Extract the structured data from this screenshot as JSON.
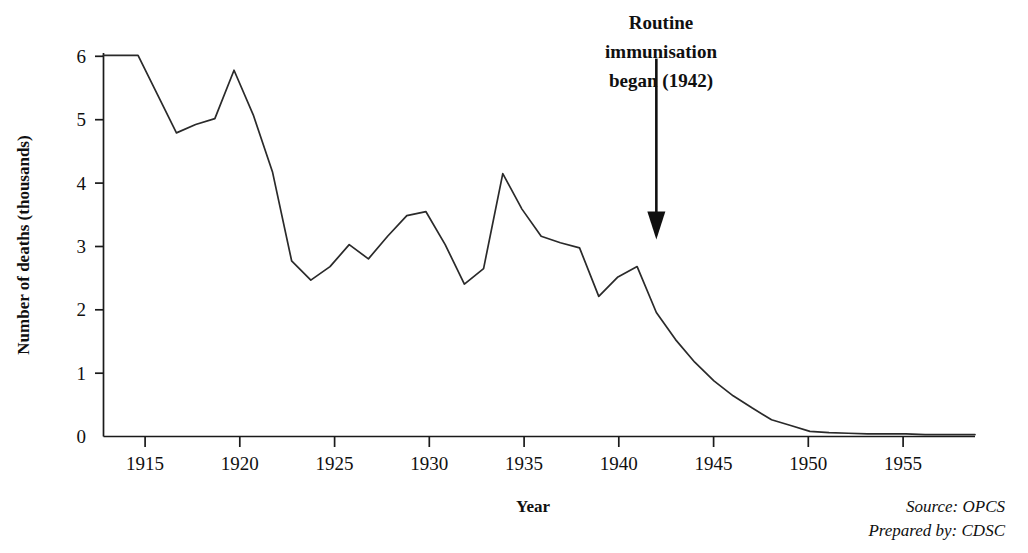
{
  "chart_data": {
    "type": "line",
    "title": "",
    "xlabel": "Year",
    "ylabel": "Number of deaths (thousands)",
    "xlim": [
      1913.2,
      1958.6
    ],
    "ylim": [
      0,
      6.2
    ],
    "xticks": [
      1915,
      1920,
      1925,
      1930,
      1935,
      1940,
      1945,
      1950,
      1955
    ],
    "xtick_labels": [
      "1915",
      "1920",
      "1925",
      "1930",
      "1935",
      "1940",
      "1945",
      "1950",
      "1955"
    ],
    "yticks": [
      0,
      1,
      2,
      3,
      4,
      5,
      6
    ],
    "ytick_labels": [
      "0",
      "1",
      "2",
      "3",
      "4",
      "5",
      "6"
    ],
    "grid": false,
    "legend": "none",
    "series": [
      {
        "name": "Number of deaths (thousands)",
        "x": [
          1913.2,
          1915,
          1916,
          1917,
          1918,
          1919,
          1920,
          1921,
          1922,
          1923,
          1924,
          1925,
          1926,
          1927,
          1928,
          1929,
          1930,
          1931,
          1932,
          1933,
          1934,
          1935,
          1936,
          1937,
          1938,
          1939,
          1940,
          1941,
          1942,
          1943,
          1944,
          1945,
          1946,
          1947,
          1948,
          1949,
          1950,
          1951,
          1952,
          1953,
          1954,
          1955,
          1956,
          1957,
          1958.6
        ],
        "values": [
          5.9,
          5.9,
          5.3,
          4.7,
          4.83,
          4.92,
          5.67,
          4.98,
          4.1,
          2.72,
          2.42,
          2.63,
          2.97,
          2.75,
          3.1,
          3.42,
          3.48,
          2.97,
          2.36,
          2.6,
          4.07,
          3.52,
          3.1,
          3.0,
          2.92,
          2.17,
          2.47,
          2.63,
          1.92,
          1.5,
          1.15,
          0.86,
          0.63,
          0.44,
          0.26,
          0.17,
          0.08,
          0.06,
          0.05,
          0.04,
          0.04,
          0.04,
          0.03,
          0.03,
          0.03
        ]
      }
    ],
    "annotations": [
      {
        "name": "immunisation-annotation",
        "lines": [
          "Routine",
          "immunisation",
          "began (1942)"
        ],
        "arrow_from_year": 1942,
        "arrow_from_value": 5.85,
        "arrow_to_year": 1942,
        "arrow_to_value": 3.05
      }
    ],
    "footnotes": [
      {
        "key": "Source:",
        "value": " OPCS"
      },
      {
        "key": "Prepared by:",
        "value": " CDSC"
      }
    ],
    "colors": {
      "line": "#2a2a2a",
      "axis": "#1a1a1a",
      "text": "#101010",
      "background": "#ffffff"
    }
  }
}
